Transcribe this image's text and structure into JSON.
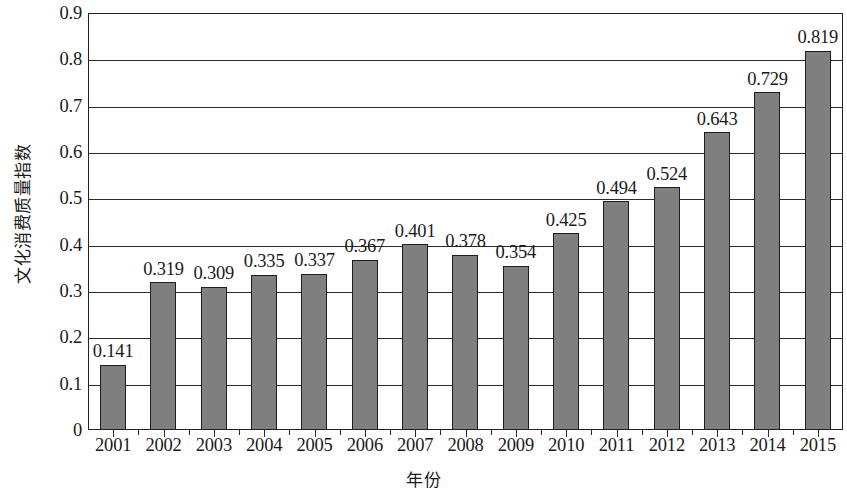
{
  "chart_data": {
    "type": "bar",
    "title": "",
    "xlabel": "年份",
    "ylabel": "文化消费质量指数",
    "categories": [
      "2001",
      "2002",
      "2003",
      "2004",
      "2005",
      "2006",
      "2007",
      "2008",
      "2009",
      "2010",
      "2011",
      "2012",
      "2013",
      "2014",
      "2015"
    ],
    "values": [
      0.141,
      0.319,
      0.309,
      0.335,
      0.337,
      0.367,
      0.401,
      0.378,
      0.354,
      0.425,
      0.494,
      0.524,
      0.643,
      0.729,
      0.819
    ],
    "value_labels": [
      "0.141",
      "0.319",
      "0.309",
      "0.335",
      "0.337",
      "0.367",
      "0.401",
      "0.378",
      "0.354",
      "0.425",
      "0.494",
      "0.524",
      "0.643",
      "0.729",
      "0.819"
    ],
    "ylim": [
      0,
      0.9
    ],
    "ytick_values": [
      0,
      0.1,
      0.2,
      0.3,
      0.4,
      0.5,
      0.6,
      0.7,
      0.8,
      0.9
    ],
    "ytick_labels": [
      "0",
      "0.1",
      "0.2",
      "0.3",
      "0.4",
      "0.5",
      "0.6",
      "0.7",
      "0.8",
      "0.9"
    ],
    "grid": true,
    "grid_axis": "y",
    "legend": false,
    "legend_position": "none",
    "bar_color": "#7f7f7f",
    "bar_edge_color": "#1e1e1e",
    "axis_color": "#222222",
    "background_color": "#ffffff",
    "data_labels_shown": true,
    "series": [
      {
        "name": "文化消费质量指数",
        "values": [
          0.141,
          0.319,
          0.309,
          0.335,
          0.337,
          0.367,
          0.401,
          0.378,
          0.354,
          0.425,
          0.494,
          0.524,
          0.643,
          0.729,
          0.819
        ]
      }
    ]
  }
}
